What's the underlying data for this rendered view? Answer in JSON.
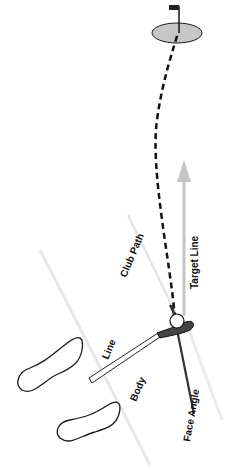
{
  "diagram": {
    "type": "golf-swing-alignment",
    "labels": {
      "club_path": "Club Path",
      "target_line": "Target Line",
      "line": "Line",
      "body": "Body",
      "face_angle": "Face Angle"
    },
    "colors": {
      "green_fill": "#c6c6c6",
      "outline": "#1a1a1a",
      "target_line": "#c4c4c4",
      "guide_line": "#e6e6e6",
      "face_line": "#333333"
    }
  }
}
